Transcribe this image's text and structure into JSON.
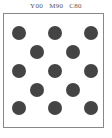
{
  "header": {
    "labels": [
      "Y00",
      "M90",
      "C80"
    ]
  },
  "swatch": {
    "border_color": "#888888",
    "background": "#ffffff",
    "dot_color": "#444444",
    "dot_radius": 7,
    "dots": [
      {
        "cx": 19,
        "cy": 33
      },
      {
        "cx": 55,
        "cy": 33
      },
      {
        "cx": 91,
        "cy": 33
      },
      {
        "cx": 37,
        "cy": 52
      },
      {
        "cx": 73,
        "cy": 52
      },
      {
        "cx": 19,
        "cy": 71
      },
      {
        "cx": 55,
        "cy": 71
      },
      {
        "cx": 91,
        "cy": 71
      },
      {
        "cx": 37,
        "cy": 90
      },
      {
        "cx": 73,
        "cy": 90
      },
      {
        "cx": 19,
        "cy": 108
      },
      {
        "cx": 55,
        "cy": 108
      },
      {
        "cx": 91,
        "cy": 108
      }
    ]
  }
}
